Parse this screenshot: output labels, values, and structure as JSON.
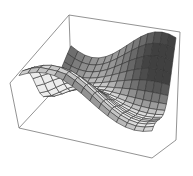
{
  "chart_data": {
    "type": "surface3d",
    "title": "",
    "xlabel": "",
    "ylabel": "",
    "zlabel": "",
    "mesh": {
      "rows": 15,
      "cols": 15
    },
    "bounding_box": true,
    "axes_ticks": false,
    "colors": {
      "surface_light": "#e6e6e6",
      "surface_dark": "#4a4a4a",
      "mesh_line": "#333333",
      "box_line": "#777777"
    }
  },
  "box": {
    "top_back_left": [
      69,
      15
    ],
    "top_back_right": [
      180,
      32
    ],
    "top_left": [
      10,
      83
    ],
    "bottom_left": [
      19,
      128
    ],
    "bottom_front": [
      152,
      158
    ],
    "bottom_right": [
      176,
      140
    ],
    "back_left_bottom": [
      71,
      72
    ]
  }
}
